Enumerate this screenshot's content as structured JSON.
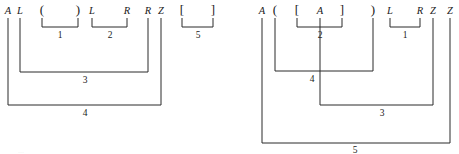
{
  "figure": {
    "kind": "bracket-nesting-diagram-pair",
    "background_color": "#ffffff",
    "line_color": "#2b2b2b",
    "text_color": "#1a1a1a",
    "partial_caption_bottom_left": "..."
  },
  "diagrams": [
    {
      "id": "left",
      "symbols": [
        {
          "label": "A",
          "kind": "letter",
          "x": 8
        },
        {
          "label": "L",
          "kind": "letter",
          "x": 20
        },
        {
          "label": "(",
          "kind": "punct",
          "x": 42
        },
        {
          "label": ")",
          "kind": "punct",
          "x": 78
        },
        {
          "label": "L",
          "kind": "letter",
          "x": 92
        },
        {
          "label": "R",
          "kind": "letter",
          "x": 127
        },
        {
          "label": "R",
          "kind": "letter",
          "x": 148
        },
        {
          "label": "Z",
          "kind": "letter",
          "x": 161
        },
        {
          "label": "[",
          "kind": "punct",
          "x": 182
        },
        {
          "label": "]",
          "kind": "punct",
          "x": 213
        }
      ],
      "brackets": [
        {
          "level": "1",
          "from_x": 42,
          "to_x": 78,
          "depth_y": 27,
          "label_x": 60,
          "label_y": 38
        },
        {
          "level": "2",
          "from_x": 92,
          "to_x": 127,
          "depth_y": 27,
          "label_x": 110,
          "label_y": 38
        },
        {
          "level": "5",
          "from_x": 182,
          "to_x": 213,
          "depth_y": 27,
          "label_x": 198,
          "label_y": 38
        },
        {
          "level": "3",
          "from_x": 20,
          "to_x": 148,
          "depth_y": 72,
          "label_x": 85,
          "label_y": 83
        },
        {
          "level": "4",
          "from_x": 8,
          "to_x": 161,
          "depth_y": 105,
          "label_x": 85,
          "label_y": 116
        }
      ]
    },
    {
      "id": "right",
      "symbols": [
        {
          "label": "A",
          "kind": "letter",
          "x": 262
        },
        {
          "label": "(",
          "kind": "punct",
          "x": 275
        },
        {
          "label": "[",
          "kind": "punct",
          "x": 297
        },
        {
          "label": "A",
          "kind": "letter",
          "x": 320
        },
        {
          "label": "]",
          "kind": "punct",
          "x": 342
        },
        {
          "label": ")",
          "kind": "punct",
          "x": 373
        },
        {
          "label": "L",
          "kind": "letter",
          "x": 390
        },
        {
          "label": "R",
          "kind": "letter",
          "x": 420
        },
        {
          "label": "Z",
          "kind": "letter",
          "x": 433
        },
        {
          "label": "Z",
          "kind": "letter",
          "x": 450
        }
      ],
      "brackets": [
        {
          "level": "2",
          "from_x": 297,
          "to_x": 342,
          "depth_y": 27,
          "label_x": 320,
          "label_y": 38
        },
        {
          "level": "1",
          "from_x": 390,
          "to_x": 420,
          "depth_y": 27,
          "label_x": 405,
          "label_y": 38
        },
        {
          "level": "4",
          "from_x": 275,
          "to_x": 373,
          "depth_y": 71,
          "label_x": 312,
          "label_y": 82
        },
        {
          "level": "3",
          "from_x": 320,
          "to_x": 433,
          "depth_y": 105,
          "label_x": 382,
          "label_y": 116
        },
        {
          "level": "5",
          "from_x": 262,
          "to_x": 450,
          "depth_y": 143,
          "label_x": 355,
          "label_y": 153
        }
      ]
    }
  ]
}
